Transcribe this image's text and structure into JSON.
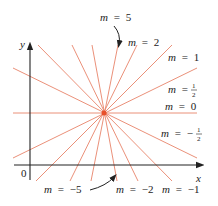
{
  "diagram": {
    "colors": {
      "line": "#e8836a",
      "axis": "#222222",
      "point": "#e8502a"
    },
    "axes": {
      "x_label": "x",
      "y_label": "y",
      "origin_label": "0"
    },
    "center_point": {
      "x": 104,
      "y": 113
    },
    "slopes": [
      {
        "m": "5",
        "label_var": "m",
        "label_eq": "=",
        "label_val": "5"
      },
      {
        "m": "2",
        "label_var": "m",
        "label_eq": "=",
        "label_val": "2"
      },
      {
        "m": "1",
        "label_var": "m",
        "label_eq": "=",
        "label_val": "1"
      },
      {
        "m": "1/2",
        "label_var": "m",
        "label_eq": "=",
        "label_val_num": "1",
        "label_val_den": "2"
      },
      {
        "m": "0",
        "label_var": "m",
        "label_eq": "=",
        "label_val": "0"
      },
      {
        "m": "-1/2",
        "label_var": "m",
        "label_eq": "=",
        "label_sign": "−",
        "label_val_num": "1",
        "label_val_den": "2"
      },
      {
        "m": "-1",
        "label_var": "m",
        "label_eq": "=",
        "label_val": "−1"
      },
      {
        "m": "-2",
        "label_var": "m",
        "label_eq": "=",
        "label_val": "−2"
      },
      {
        "m": "-5",
        "label_var": "m",
        "label_eq": "=",
        "label_val": "−5"
      }
    ]
  }
}
